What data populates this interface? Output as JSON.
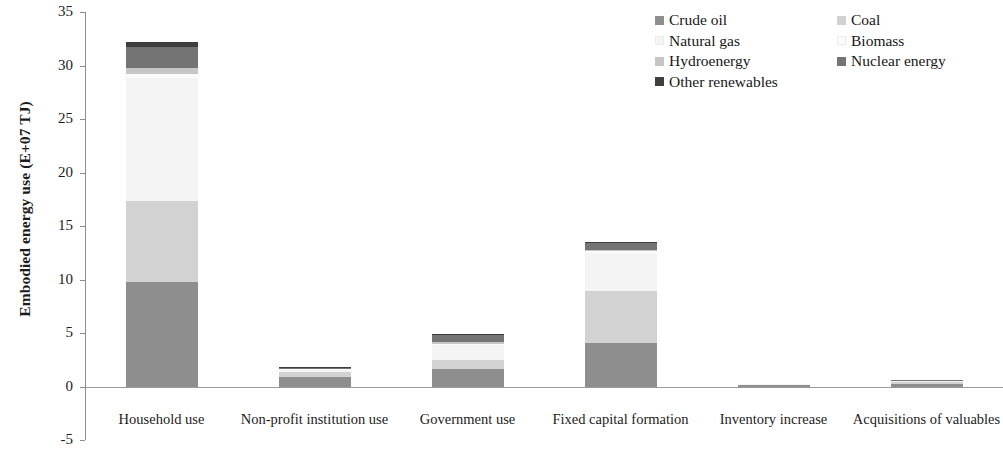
{
  "chart_data": {
    "type": "bar",
    "subtype": "stacked-bar",
    "title": "",
    "xlabel": "",
    "ylabel": "Embodied energy use (E+07 TJ)",
    "ylim": [
      -5,
      35
    ],
    "ytick_step": 5,
    "yticks": [
      35,
      30,
      25,
      20,
      15,
      10,
      5,
      0,
      -5
    ],
    "ytick_labels": [
      "35",
      "30",
      "25",
      "20",
      "15",
      "10",
      "5",
      "0",
      "-5"
    ],
    "grid": false,
    "legend_position": "top-right",
    "categories": [
      "Household use",
      "Non-profit institution use",
      "Government use",
      "Fixed capital formation",
      "Inventory increase",
      "Acquisitions of valuables"
    ],
    "series": [
      {
        "name": "Crude oil",
        "color": "#8e8e8e",
        "values": [
          9.8,
          0.95,
          1.65,
          4.1,
          0.15,
          0.3
        ]
      },
      {
        "name": "Coal",
        "color": "#d2d2d2",
        "values": [
          7.6,
          0.45,
          0.85,
          4.9,
          0.08,
          0.18
        ]
      },
      {
        "name": "Natural gas",
        "color": "#f4f4f4",
        "values": [
          11.5,
          0.22,
          1.45,
          3.55,
          0.04,
          0.09
        ]
      },
      {
        "name": "Biomass",
        "color": "#fbfbfb",
        "values": [
          0.35,
          0.03,
          0.1,
          0.12,
          0.01,
          0.01
        ]
      },
      {
        "name": "Hydroenergy",
        "color": "#c6c6c6",
        "values": [
          0.55,
          0.05,
          0.18,
          0.18,
          0.01,
          0.01
        ]
      },
      {
        "name": "Nuclear energy",
        "color": "#747474",
        "values": [
          2.0,
          0.12,
          0.65,
          0.65,
          0.03,
          0.05
        ]
      },
      {
        "name": "Other renewables",
        "color": "#3f3f3f",
        "values": [
          0.45,
          0.03,
          0.12,
          0.1,
          0.01,
          0.01
        ]
      }
    ],
    "totals": [
      32.25,
      1.85,
      5.0,
      13.6,
      0.33,
      0.65
    ]
  },
  "legend": {
    "left_column": [
      {
        "label": "Crude oil",
        "color": "#8e8e8e",
        "has_swatch": true
      },
      {
        "label": "Natural gas",
        "color": "#f4f4f4",
        "has_swatch": true
      },
      {
        "label": "Hydroenergy",
        "color": "#c6c6c6",
        "has_swatch": true
      },
      {
        "label": "Other renewables",
        "color": "#3f3f3f",
        "has_swatch": true
      }
    ],
    "right_column": [
      {
        "label": "Coal",
        "color": "#d2d2d2",
        "has_swatch": true
      },
      {
        "label": "Biomass",
        "color": "#fbfbfb",
        "has_swatch": true
      },
      {
        "label": "Nuclear energy",
        "color": "#747474",
        "has_swatch": true
      }
    ]
  },
  "axes": {
    "y_title": "Embodied energy use (E+07 TJ)",
    "axis_color": "#8d8d8d"
  }
}
